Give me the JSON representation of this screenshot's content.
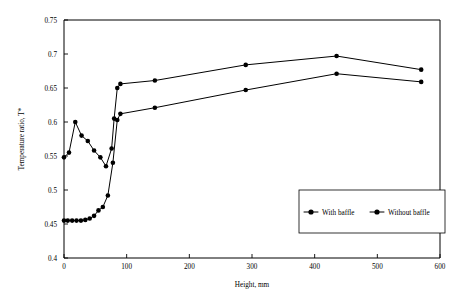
{
  "chart_data": {
    "type": "line",
    "title": "",
    "xlabel": "Height, mm",
    "ylabel": "Temperature ratio, T*",
    "xlim": [
      0,
      600
    ],
    "ylim": [
      0.4,
      0.75
    ],
    "xticks": [
      0,
      100,
      200,
      300,
      400,
      500,
      600
    ],
    "yticks": [
      0.4,
      0.45,
      0.5,
      0.55,
      0.6,
      0.65,
      0.7,
      0.75
    ],
    "xtick_labels": [
      "0",
      "100",
      "200",
      "300",
      "400",
      "500",
      "600"
    ],
    "ytick_labels": [
      "0.4",
      "0.45",
      "0.5",
      "0.55",
      "0.6",
      "0.65",
      "0.7",
      "0.75"
    ],
    "grid": false,
    "legend_position": "lower-right",
    "marker": "filled-circle",
    "line_color": "#000000",
    "series": [
      {
        "name": "With baffle",
        "x": [
          0,
          8,
          18,
          28,
          38,
          48,
          58,
          67,
          76,
          80,
          85,
          90,
          145,
          290,
          435,
          570
        ],
        "values": [
          0.548,
          0.555,
          0.6,
          0.58,
          0.572,
          0.558,
          0.548,
          0.535,
          0.561,
          0.605,
          0.65,
          0.656,
          0.661,
          0.684,
          0.697,
          0.677
        ]
      },
      {
        "name": "Without baffle",
        "x": [
          0,
          6,
          13,
          20,
          27,
          34,
          41,
          48,
          55,
          62,
          70,
          78,
          85,
          90,
          145,
          290,
          435,
          570
        ],
        "values": [
          0.455,
          0.455,
          0.455,
          0.455,
          0.455,
          0.456,
          0.458,
          0.462,
          0.47,
          0.475,
          0.492,
          0.54,
          0.603,
          0.612,
          0.621,
          0.647,
          0.671,
          0.659
        ]
      }
    ]
  }
}
